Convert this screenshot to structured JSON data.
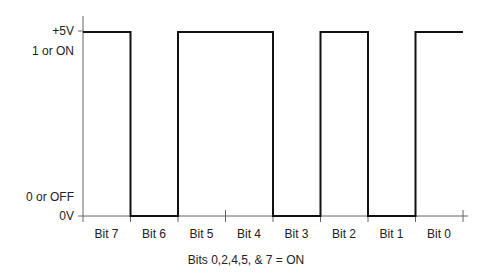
{
  "y_axis": {
    "labels": [
      {
        "text": "+5V",
        "y": 24
      },
      {
        "text": "1 or ON",
        "y": 44
      },
      {
        "text": "0 or OFF",
        "y": 190
      },
      {
        "text": "0V",
        "y": 209
      }
    ]
  },
  "x_axis": {
    "bits": [
      "Bit 7",
      "Bit 6",
      "Bit 5",
      "Bit 4",
      "Bit 3",
      "Bit 2",
      "Bit 1",
      "Bit 0"
    ]
  },
  "caption": "Bits 0,2,4,5, & 7 = ON",
  "signal": {
    "states": [
      1,
      0,
      1,
      1,
      0,
      1,
      0,
      1
    ]
  },
  "colors": {
    "line": "#111111",
    "axis": "#555555",
    "text": "#222222"
  }
}
